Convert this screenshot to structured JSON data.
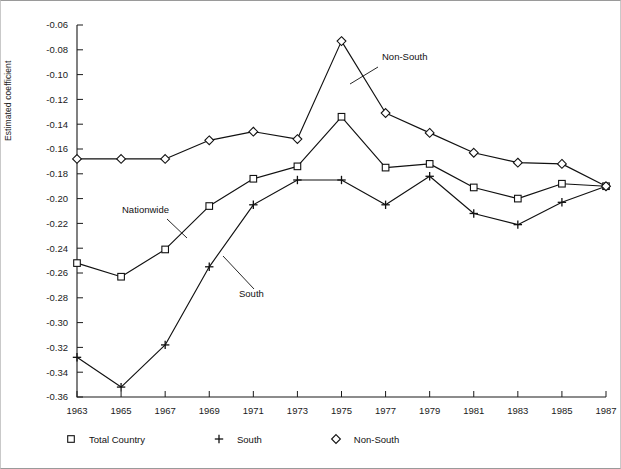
{
  "chart_data": {
    "type": "line",
    "title": "",
    "xlabel": "",
    "ylabel": "Estimated coefficient",
    "x": [
      1963,
      1965,
      1967,
      1969,
      1971,
      1973,
      1975,
      1977,
      1979,
      1981,
      1983,
      1985,
      1987
    ],
    "xtick_labels": [
      "1963",
      "1965",
      "1967",
      "1969",
      "1971",
      "1973",
      "1975",
      "1977",
      "1979",
      "1981",
      "1983",
      "1985",
      "1987"
    ],
    "ytick_labels": [
      "-0.06",
      "-0.08",
      "-0.10",
      "-0.12",
      "-0.14",
      "-0.16",
      "-0.18",
      "-0.20",
      "-0.22",
      "-0.24",
      "-0.26",
      "-0.28",
      "-0.30",
      "-0.32",
      "-0.34",
      "-0.36"
    ],
    "ytick_values": [
      -0.06,
      -0.08,
      -0.1,
      -0.12,
      -0.14,
      -0.16,
      -0.18,
      -0.2,
      -0.22,
      -0.24,
      -0.26,
      -0.28,
      -0.3,
      -0.32,
      -0.34,
      -0.36
    ],
    "ylim": [
      -0.36,
      -0.06
    ],
    "xlim": [
      1963,
      1987
    ],
    "grid": false,
    "legend_position": "bottom",
    "series": [
      {
        "name": "Total Country",
        "marker": "square",
        "values": [
          -0.252,
          -0.263,
          -0.241,
          -0.206,
          -0.184,
          -0.174,
          -0.134,
          -0.175,
          -0.172,
          -0.191,
          -0.2,
          -0.188,
          -0.19
        ]
      },
      {
        "name": "South",
        "marker": "plus",
        "values": [
          -0.328,
          -0.352,
          -0.318,
          -0.255,
          -0.205,
          -0.185,
          -0.185,
          -0.205,
          -0.182,
          -0.212,
          -0.221,
          -0.203,
          -0.19
        ]
      },
      {
        "name": "Non-South",
        "marker": "diamond",
        "values": [
          -0.168,
          -0.168,
          -0.168,
          -0.153,
          -0.146,
          -0.152,
          -0.073,
          -0.131,
          -0.147,
          -0.163,
          -0.171,
          -0.172,
          -0.19
        ]
      }
    ],
    "annotations": [
      {
        "text": "Non-South",
        "x_px": 381,
        "y_px": 59,
        "leader_from_px": [
          377,
          66
        ],
        "leader_to_px": [
          349,
          83
        ]
      },
      {
        "text": "Nationwide",
        "x_px": 121,
        "y_px": 212,
        "leader_from_px": [
          166,
          218
        ],
        "leader_to_px": [
          186,
          237
        ]
      },
      {
        "text": "South",
        "x_px": 238,
        "y_px": 296,
        "leader_from_px": [
          253,
          288
        ],
        "leader_to_px": [
          222,
          255
        ]
      }
    ]
  },
  "legend": {
    "items": [
      {
        "label": "Total Country",
        "marker": "square"
      },
      {
        "label": "South",
        "marker": "plus"
      },
      {
        "label": "Non-South",
        "marker": "diamond"
      }
    ]
  },
  "colors": {
    "line": "#111111",
    "axis": "#1a1a1a",
    "background": "#ffffff",
    "frame": "#9a9a9a"
  }
}
